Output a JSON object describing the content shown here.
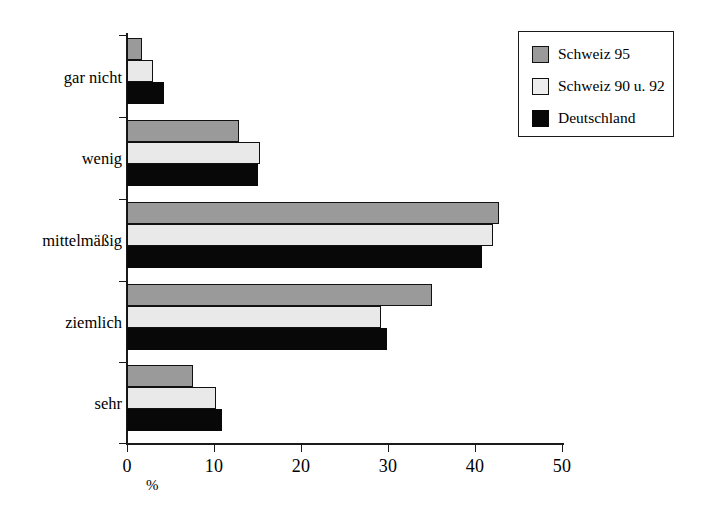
{
  "chart_data": {
    "type": "bar",
    "orientation": "horizontal",
    "title": "",
    "xlabel": "%",
    "ylabel": "",
    "xlim": [
      0,
      50
    ],
    "xticks": [
      0,
      10,
      20,
      30,
      40,
      50
    ],
    "xtick_labels": [
      "0",
      "10",
      "20",
      "30",
      "40",
      "50"
    ],
    "grid": false,
    "legend_position": "top-right",
    "categories": [
      "gar nicht",
      "wenig",
      "mittelmäßig",
      "ziemlich",
      "sehr"
    ],
    "series": [
      {
        "name": "Schweiz 95",
        "color": "#9a9a9a",
        "values": [
          1.7,
          12.9,
          42.8,
          35.1,
          7.6
        ]
      },
      {
        "name": "Schweiz 90 u. 92",
        "color": "#e9e9e9",
        "values": [
          3.0,
          15.3,
          42.1,
          29.2,
          10.2
        ]
      },
      {
        "name": "Deutschland",
        "color": "#080808",
        "values": [
          4.3,
          15.0,
          40.8,
          29.9,
          10.9
        ]
      }
    ]
  },
  "legend": {
    "items": [
      {
        "label": "Schweiz 95",
        "swatch": "swatch-schweiz-95"
      },
      {
        "label": "Schweiz 90 u. 92",
        "swatch": "swatch-schweiz-90-92"
      },
      {
        "label": "Deutschland",
        "swatch": "swatch-deutschland"
      }
    ]
  },
  "axis": {
    "x_title": "%",
    "x_tick_labels": [
      "0",
      "10",
      "20",
      "30",
      "40",
      "50"
    ],
    "y_tick_labels": [
      "gar nicht",
      "wenig",
      "mittelmäßig",
      "ziemlich",
      "sehr"
    ]
  }
}
